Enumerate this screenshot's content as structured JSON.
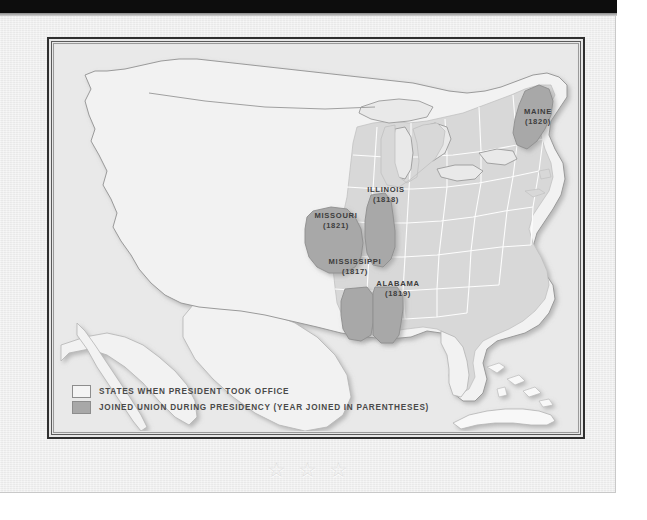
{
  "document": {
    "type": "historical-map-page",
    "sheet_color": "#eeeeee",
    "frame_color": "#2f2f2f"
  },
  "map": {
    "title": "United States Map",
    "colors": {
      "existing_states": "#d8d8d8",
      "joined_states": "#a8a8a8",
      "territory": "#f2f2f2",
      "water": "#e9e9e9",
      "border": "#ffffff",
      "outline": "#9a9a9a"
    },
    "state_labels": [
      {
        "name": "Maine",
        "year": "(1820)",
        "x": 481,
        "y": 72
      },
      {
        "name": "Illinois",
        "year": "(1818)",
        "x": 333,
        "y": 181
      },
      {
        "name": "Missouri",
        "year": "(1821)",
        "x": 298,
        "y": 206
      },
      {
        "name": "Mississippi",
        "year": "(1817)",
        "x": 327,
        "y": 251
      },
      {
        "name": "Alabama",
        "year": "(1819)",
        "x": 368,
        "y": 272
      }
    ]
  },
  "legend": {
    "items": [
      {
        "swatch": "existing",
        "label": "States when President took office"
      },
      {
        "swatch": "joined",
        "label": "Joined Union during presidency (year joined in parentheses)"
      }
    ]
  },
  "decoration": {
    "stars": [
      "☆",
      "☆",
      "☆"
    ],
    "star_count": 3
  }
}
